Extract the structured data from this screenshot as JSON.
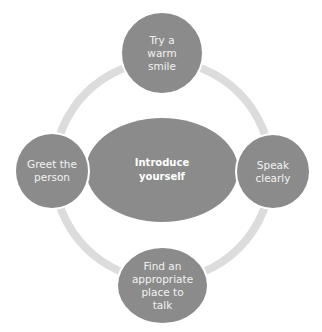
{
  "diagram": {
    "type": "cycle",
    "center": {
      "label": "Introduce yourself",
      "lines": [
        "Introduce",
        "yourself"
      ]
    },
    "nodes": [
      {
        "position": "top",
        "label": "Try a warm smile",
        "lines": [
          "Try a",
          "warm",
          "smile"
        ]
      },
      {
        "position": "right",
        "label": "Speak clearly",
        "lines": [
          "Speak",
          "clearly"
        ]
      },
      {
        "position": "bottom",
        "label": "Find an appropriate place to talk",
        "lines": [
          "Find an",
          "appropriate",
          "place to",
          "talk"
        ]
      },
      {
        "position": "left",
        "label": "Greet the person",
        "lines": [
          "Greet the",
          "person"
        ]
      }
    ],
    "colors": {
      "node_fill": "#8b8b8b",
      "ring": "#dcdcdc",
      "text": "#f2f2f2",
      "node_outline": "#ffffff",
      "background": "#ffffff"
    }
  }
}
